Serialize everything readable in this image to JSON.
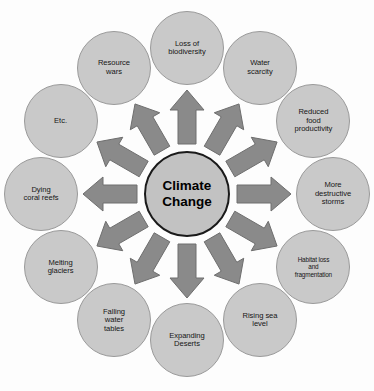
{
  "diagram": {
    "hub": {
      "label": "Climate\nChange",
      "fill": "#c2c2c2",
      "stroke": "#1a1a1a"
    },
    "arrow": {
      "fill": "#8a8a8a",
      "stroke": "#6e6e6e",
      "count": 12,
      "direction": "outward-from-hub"
    },
    "node_style": {
      "fill": "#c9c9c9",
      "stroke": "#9a9a9a"
    },
    "nodes": [
      {
        "id": "loss-of-biodiversity",
        "label": "Loss of\nbiodiversity",
        "angle_deg": 270,
        "small": false
      },
      {
        "id": "water-scarcity",
        "label": "Water\nscarcity",
        "angle_deg": 300,
        "small": false
      },
      {
        "id": "reduced-food-productivity",
        "label": "Reduced\nfood\nproductivity",
        "angle_deg": 330,
        "small": false
      },
      {
        "id": "more-destructive-storms",
        "label": "More\ndestructive\nstorms",
        "angle_deg": 0,
        "small": false
      },
      {
        "id": "habitat-loss-fragmentation",
        "label": "Habitat loss\nand\nfragmentation",
        "angle_deg": 30,
        "small": true
      },
      {
        "id": "rising-sea-level",
        "label": "Rising sea\nlevel",
        "angle_deg": 60,
        "small": false
      },
      {
        "id": "expanding-deserts",
        "label": "Expanding\nDeserts",
        "angle_deg": 90,
        "small": false
      },
      {
        "id": "falling-water-tables",
        "label": "Falling\nwater\ntables",
        "angle_deg": 120,
        "small": false
      },
      {
        "id": "melting-glaciers",
        "label": "Melting\nglaciers",
        "angle_deg": 150,
        "small": false
      },
      {
        "id": "dying-coral-reefs",
        "label": "Dying\ncoral reefs",
        "angle_deg": 180,
        "small": false
      },
      {
        "id": "etc",
        "label": "Etc.",
        "angle_deg": 210,
        "small": false
      },
      {
        "id": "resource-wars",
        "label": "Resource\nwars",
        "angle_deg": 240,
        "small": false
      }
    ]
  }
}
